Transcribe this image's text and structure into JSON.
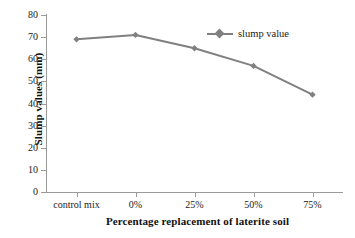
{
  "chart_data": {
    "type": "line",
    "title": "",
    "categories": [
      "control mix",
      "0%",
      "25%",
      "50%",
      "75%"
    ],
    "series": [
      {
        "name": "slump value",
        "values": [
          69,
          71,
          65,
          57,
          44
        ],
        "color": "#808080",
        "marker": "diamond"
      }
    ],
    "xlabel": "Percentage replacement of laterite soil",
    "ylabel": "Slump values (mm)",
    "ylim": [
      0,
      80
    ],
    "yticks": [
      0,
      10,
      20,
      30,
      40,
      50,
      60,
      70,
      80
    ],
    "ytick_labels": [
      "0",
      "10",
      "20",
      "30",
      "40",
      "50",
      "60",
      "70",
      "80"
    ],
    "grid": false,
    "legend_position": "top-right",
    "legend_entries": [
      "slump value"
    ],
    "axis_color": "#9a9a9a",
    "text_color": "#1a1a1a",
    "background": "#ffffff"
  },
  "axis": {
    "x_title": "Percentage replacement of laterite soil",
    "y_title": "Slump values (mm)"
  },
  "legend": {
    "items": [
      {
        "label": "slump value",
        "color": "#808080"
      }
    ]
  }
}
